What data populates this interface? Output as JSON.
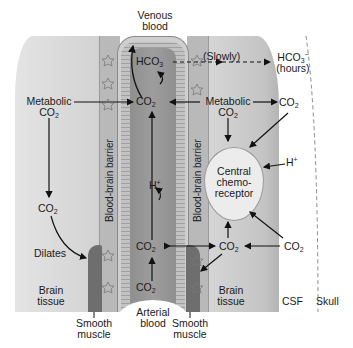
{
  "colors": {
    "brain_tissue_left": "#d9d9d9",
    "brain_tissue_right": "#c8c8c8",
    "barrier": "#b9b9b9",
    "vessel_wall": "#a8a8a8",
    "vessel_lumen": "#959595",
    "csf": "#e6e6e6",
    "skull": "#dcdcdc",
    "smooth_muscle": "#6e6e6e",
    "chemoreceptor": "#ececec"
  },
  "labels": {
    "venous_blood_line1": "Venous",
    "venous_blood_line2": "blood",
    "arterial_blood_line1": "Arterial",
    "arterial_blood_line2": "blood",
    "slowly": "(Slowly)",
    "hco3_csf": "HCO",
    "hco3_csf_sub": "3",
    "hco3_csf_sup": "−",
    "hours": "(hours)",
    "hco3_vessel": "HCO",
    "hco3_vessel_sub": "3",
    "metabolic_left": "Metabolic",
    "metabolic_right": "Metabolic",
    "co2": "CO",
    "co2_sub": "2",
    "h_plus_vessel": "H",
    "h_plus_right": "H",
    "plus": "+",
    "dilates": "Dilates",
    "barrier_left": "Blood-brain barrier",
    "barrier_right": "Blood-brain barrier",
    "chemoreceptor_line1": "Central",
    "chemoreceptor_line2": "chemo-",
    "chemoreceptor_line3": "receptor",
    "brain_tissue_left_1": "Brain",
    "brain_tissue_left_2": "tissue",
    "brain_tissue_right_1": "Brain",
    "brain_tissue_right_2": "tissue",
    "csf": "CSF",
    "skull": "Skull",
    "smooth_muscle_left_1": "Smooth",
    "smooth_muscle_left_2": "muscle",
    "smooth_muscle_right_1": "Smooth",
    "smooth_muscle_right_2": "muscle"
  },
  "icons": {
    "astrocyte": "star-cell-icon"
  }
}
